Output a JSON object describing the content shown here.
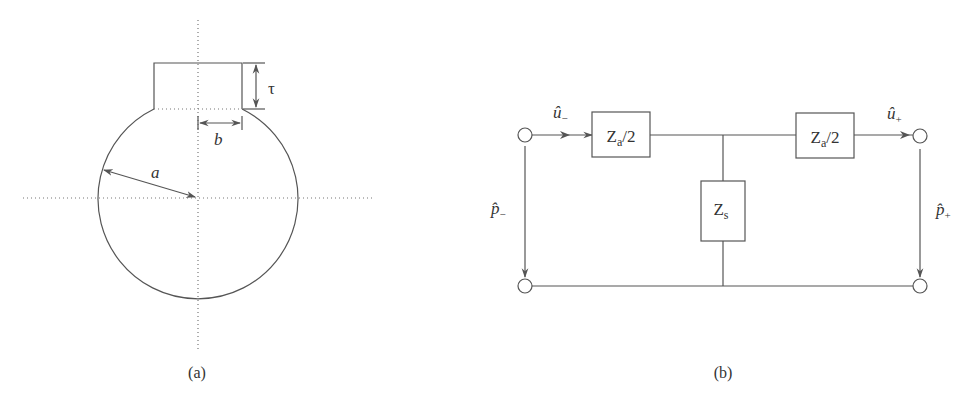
{
  "figure_a": {
    "caption": "(a)",
    "labels": {
      "tau": "τ",
      "b": "b",
      "a": "a"
    }
  },
  "figure_b": {
    "caption": "(b)",
    "boxes": {
      "left": {
        "main": "Z",
        "sub": "a",
        "tail": "/2"
      },
      "right": {
        "main": "Z",
        "sub": "a",
        "tail": "/2"
      },
      "shunt": {
        "main": "Z",
        "sub": "s"
      }
    },
    "labels": {
      "u_minus": {
        "main": "û",
        "sub": "−"
      },
      "u_plus": {
        "main": "û",
        "sub": "+"
      },
      "p_minus": {
        "main": "p̂",
        "sub": "−"
      },
      "p_plus": {
        "main": "p̂",
        "sub": "+"
      }
    }
  },
  "colors": {
    "stroke": "#555555",
    "text": "#333333",
    "background": "#ffffff"
  }
}
